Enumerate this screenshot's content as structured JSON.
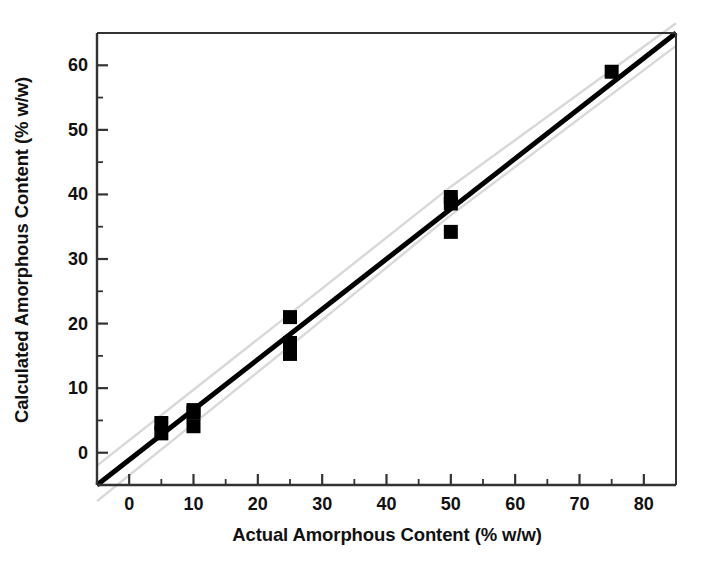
{
  "chart_data": {
    "type": "scatter",
    "title": "",
    "xlabel": "Actual Amorphous Content (% w/w)",
    "ylabel": "Calculated Amorphous Content (% w/w)",
    "xlim": [
      -5,
      85
    ],
    "ylim": [
      -5,
      65
    ],
    "xticks": [
      0,
      10,
      20,
      30,
      40,
      50,
      60,
      70,
      80
    ],
    "xtick_labels": [
      "0",
      "10",
      "20",
      "30",
      "40",
      "50",
      "60",
      "70",
      "80"
    ],
    "xminor_interval": 5,
    "yticks": [
      0,
      10,
      20,
      30,
      40,
      50,
      60
    ],
    "ytick_labels": [
      "0",
      "10",
      "20",
      "30",
      "40",
      "50",
      "60"
    ],
    "yminor_interval": 5,
    "grid": false,
    "legend": "none",
    "marker": "filled-square",
    "marker_color": "#000000",
    "series": [
      {
        "name": "Calculated vs Actual amorphous content",
        "points": [
          {
            "x": 5,
            "y": 4.6
          },
          {
            "x": 5,
            "y": 3.0
          },
          {
            "x": 10,
            "y": 6.6
          },
          {
            "x": 10,
            "y": 6.2
          },
          {
            "x": 10,
            "y": 4.1
          },
          {
            "x": 25,
            "y": 21.0
          },
          {
            "x": 25,
            "y": 17.0
          },
          {
            "x": 25,
            "y": 15.3
          },
          {
            "x": 50,
            "y": 39.6
          },
          {
            "x": 50,
            "y": 38.6
          },
          {
            "x": 50,
            "y": 34.2
          },
          {
            "x": 75,
            "y": 59.0
          }
        ]
      }
    ],
    "fit_line": {
      "name": "regression-line",
      "color": "#000000",
      "width_px": 5,
      "x_start": -5,
      "y_start": -5,
      "x_end": 85,
      "y_end": 65,
      "slope": 0.778,
      "intercept": -1.11
    },
    "confidence_bands": {
      "name": "confidence-interval-bands",
      "color": "#d8d8d8",
      "upper": [
        {
          "x": -5,
          "y": -2.0
        },
        {
          "x": 25,
          "y": 21.5
        },
        {
          "x": 50,
          "y": 41.2
        },
        {
          "x": 85,
          "y": 66.5
        }
      ],
      "lower": [
        {
          "x": -5,
          "y": -7.5
        },
        {
          "x": 25,
          "y": 16.5
        },
        {
          "x": 50,
          "y": 36.8
        },
        {
          "x": 85,
          "y": 63.0
        }
      ]
    }
  },
  "axes": {
    "frame_color": "#333333",
    "tick_color": "#333333"
  }
}
